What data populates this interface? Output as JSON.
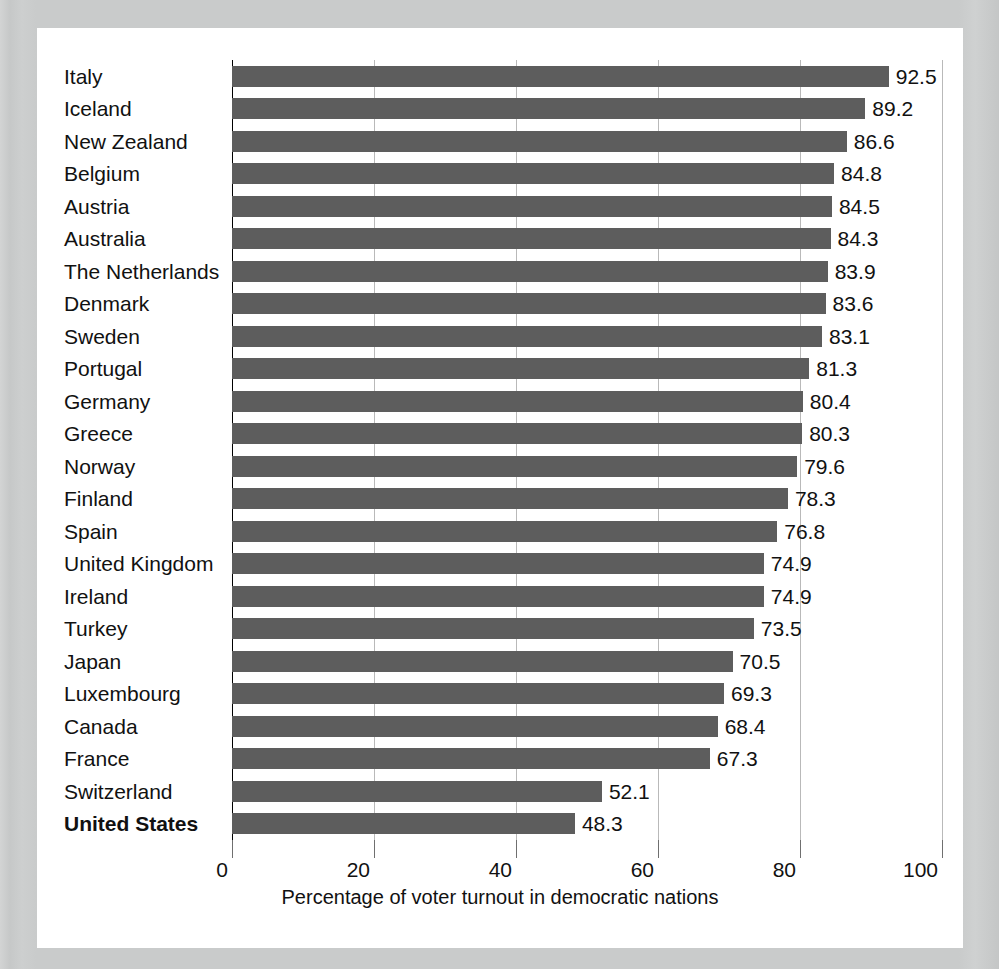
{
  "chart_data": {
    "type": "bar",
    "orientation": "horizontal",
    "title": "",
    "subtitle": "",
    "xlabel": "Percentage of voter turnout in democratic nations",
    "ylabel": "",
    "xlim": [
      0,
      100
    ],
    "xticks": [
      "0",
      "20",
      "40",
      "60",
      "80",
      "100"
    ],
    "grid": "vertical",
    "legend": "none",
    "bar_color": "#5d5d5d",
    "highlight_category": "United States",
    "categories": [
      "Italy",
      "Iceland",
      "New Zealand",
      "Belgium",
      "Austria",
      "Australia",
      "The Netherlands",
      "Denmark",
      "Sweden",
      "Portugal",
      "Germany",
      "Greece",
      "Norway",
      "Finland",
      "Spain",
      "United Kingdom",
      "Ireland",
      "Turkey",
      "Japan",
      "Luxembourg",
      "Canada",
      "France",
      "Switzerland",
      "United States"
    ],
    "values": [
      92.5,
      89.2,
      86.6,
      84.8,
      84.5,
      84.3,
      83.9,
      83.6,
      83.1,
      81.3,
      80.4,
      80.3,
      79.6,
      78.3,
      76.8,
      74.9,
      74.9,
      73.5,
      70.5,
      69.3,
      68.4,
      67.3,
      52.1,
      48.3
    ],
    "value_labels": [
      "92.5",
      "89.2",
      "86.6",
      "84.8",
      "84.5",
      "84.3",
      "83.9",
      "83.6",
      "83.1",
      "81.3",
      "80.4",
      "80.3",
      "79.6",
      "78.3",
      "76.8",
      "74.9",
      "74.9",
      "73.5",
      "70.5",
      "69.3",
      "68.4",
      "67.3",
      "52.1",
      "48.3"
    ]
  },
  "colors": {
    "bar": "#5d5d5d",
    "panel_background": "#ffffff",
    "outer_background": "#c9cbcb",
    "gridline": "#b9b9b9",
    "axis": "#000000",
    "text": "#111111"
  }
}
